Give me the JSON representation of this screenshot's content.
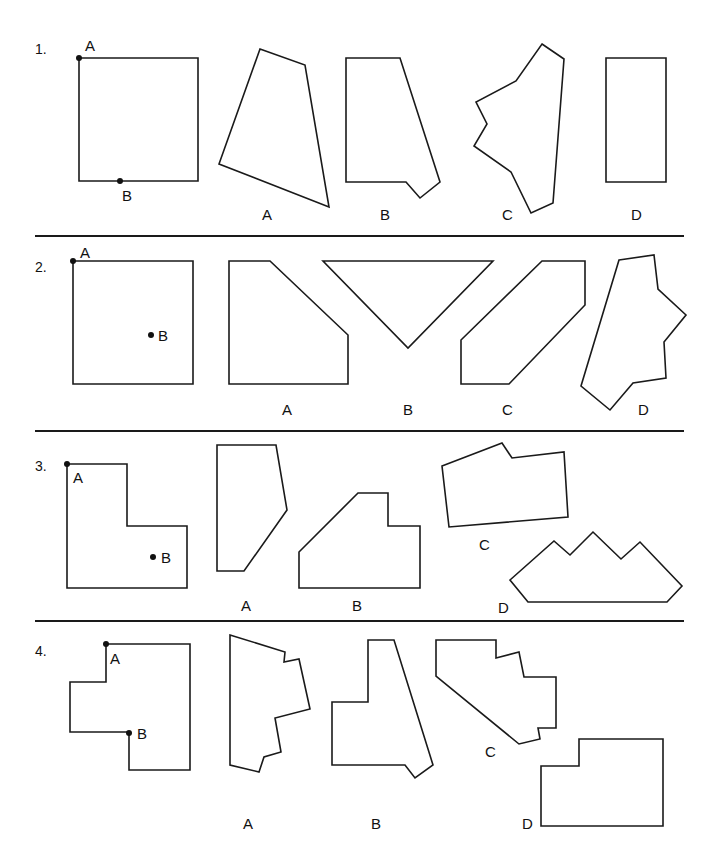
{
  "separators": [
    {
      "y": 236,
      "x1": 35,
      "x2": 684
    },
    {
      "y": 431,
      "x1": 35,
      "x2": 684
    },
    {
      "y": 621,
      "x1": 35,
      "x2": 684
    }
  ],
  "problems": [
    {
      "number": "1.",
      "number_pos": [
        35,
        42
      ],
      "source_shape": {
        "points": "79,58 198,58 198,181 79,181",
        "markers": [
          {
            "label": "A",
            "dot": [
              79,
              58
            ],
            "label_pos": [
              85,
              38
            ]
          },
          {
            "label": "B",
            "dot": [
              120,
              181
            ],
            "label_pos": [
              122,
              188
            ]
          }
        ]
      },
      "options": [
        {
          "label": "A",
          "points": "260,49 305,65 329,207 219,164",
          "label_pos": [
            262,
            207
          ]
        },
        {
          "label": "B",
          "points": "346,58 400,58 440,182 420,198 406,182 346,182",
          "label_pos": [
            380,
            207
          ]
        },
        {
          "label": "C",
          "points": "542,44 564,59 553,203 531,213 511,172 474,146 487,124 476,102 516,81",
          "label_pos": [
            502,
            207
          ]
        },
        {
          "label": "D",
          "points": "606,58 666,58 666,182 606,182",
          "label_pos": [
            631,
            207
          ]
        }
      ]
    },
    {
      "number": "2.",
      "number_pos": [
        35,
        260
      ],
      "source_shape": {
        "points": "73,261 193,261 193,384 73,384",
        "markers": [
          {
            "label": "A",
            "dot": [
              73,
              261
            ],
            "label_pos": [
              80,
              245
            ]
          },
          {
            "label": "B",
            "dot": [
              151,
              335
            ],
            "label_pos": [
              158,
              328
            ]
          }
        ]
      },
      "options": [
        {
          "label": "A",
          "points": "229,261 270,261 348,335 348,384 229,384",
          "label_pos": [
            282,
            402
          ]
        },
        {
          "label": "B",
          "points": "323,261 493,261 408,348",
          "label_pos": [
            403,
            402
          ]
        },
        {
          "label": "C",
          "points": "542,261 585,261 585,305 509,384 461,384 461,340",
          "label_pos": [
            502,
            402
          ]
        },
        {
          "label": "D",
          "points": "619,260 654,255 658,289 686,315 664,342 666,378 633,383 610,410 581,386",
          "label_pos": [
            638,
            402
          ]
        }
      ]
    },
    {
      "number": "3.",
      "number_pos": [
        35,
        459
      ],
      "source_shape": {
        "points": "67,464 127,464 127,526 187,526 187,588 67,588",
        "markers": [
          {
            "label": "A",
            "dot": [
              67,
              464
            ],
            "label_pos": [
              73,
              470
            ]
          },
          {
            "label": "B",
            "dot": [
              153,
              557
            ],
            "label_pos": [
              161,
              550
            ]
          }
        ]
      },
      "options": [
        {
          "label": "A",
          "points": "217,445 276,445 287,510 244,571 217,571",
          "label_pos": [
            241,
            598
          ]
        },
        {
          "label": "B",
          "points": "299,552 358,493 388,493 388,526 420,526 420,588 299,588",
          "label_pos": [
            352,
            598
          ]
        },
        {
          "label": "C",
          "points": "442,466 502,443 512,458 564,452 568,517 449,527",
          "label_pos": [
            479,
            537
          ]
        },
        {
          "label": "D",
          "points": "510,580 554,541 570,555 593,532 621,559 640,542 682,586 667,602 528,602",
          "label_pos": [
            498,
            600
          ]
        }
      ]
    },
    {
      "number": "4.",
      "number_pos": [
        35,
        644
      ],
      "source_shape": {
        "points": "106,644 190,644 190,770 129,770 129,732 70,732 70,682 106,682",
        "markers": [
          {
            "label": "A",
            "dot": [
              106,
              644
            ],
            "label_pos": [
              110,
              651
            ]
          },
          {
            "label": "B",
            "dot": [
              129,
              733
            ],
            "label_pos": [
              137,
              726
            ]
          }
        ]
      },
      "options": [
        {
          "label": "A",
          "points": "230,635 285,652 284,662 299,659 310,709 275,718 281,752 264,757 259,772 230,765",
          "label_pos": [
            243,
            816
          ]
        },
        {
          "label": "B",
          "points": "368,640 394,640 433,765 415,778 405,765 332,765 332,702 368,702",
          "label_pos": [
            371,
            816
          ]
        },
        {
          "label": "C",
          "points": "436,640 496,640 496,658 519,652 524,677 556,677 556,728 538,728 540,739 519,744 436,676",
          "label_pos": [
            485,
            744
          ]
        },
        {
          "label": "D",
          "points": "579,739 663,739 663,826 541,826 541,766 579,766",
          "label_pos": [
            522,
            816
          ]
        }
      ]
    }
  ]
}
